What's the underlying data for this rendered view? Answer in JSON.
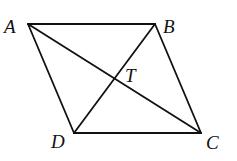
{
  "diagram": {
    "type": "parallelogram-with-diagonals",
    "vertices": {
      "A": {
        "label": "A",
        "x": 28,
        "y": 24
      },
      "B": {
        "label": "B",
        "x": 155,
        "y": 24
      },
      "C": {
        "label": "C",
        "x": 201,
        "y": 133
      },
      "D": {
        "label": "D",
        "x": 74,
        "y": 133
      }
    },
    "intersection": {
      "label": "T",
      "x": 115,
      "y": 79
    },
    "segments": [
      "AB",
      "BC",
      "CD",
      "DA",
      "AC",
      "BD"
    ],
    "stroke_color": "#111111",
    "background": "#ffffff"
  }
}
